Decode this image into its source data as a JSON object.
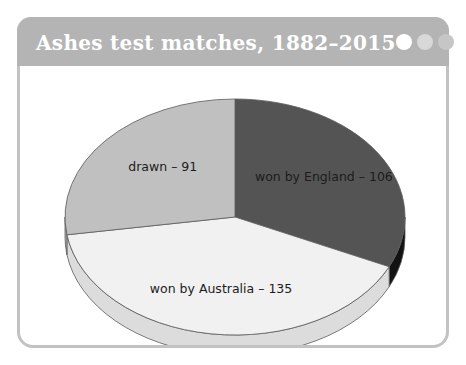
{
  "window": {
    "title": "Ashes test matches, 1882–2015",
    "dots": [
      {
        "name": "window-dot-1",
        "color": "#ffffff"
      },
      {
        "name": "window-dot-2",
        "color": "#d8d8d8"
      },
      {
        "name": "window-dot-3",
        "color": "#c6c6c6"
      }
    ],
    "title_bar_color": "#b4b4b4",
    "frame_border_color": "#c2c2c2",
    "background_color": "#ffffff"
  },
  "chart_data": {
    "type": "pie",
    "title": "Ashes test matches, 1882–2015",
    "xlabel": "",
    "ylabel": "",
    "legend": "none",
    "grid": false,
    "three_d": true,
    "start_angle_deg": 0,
    "direction": "clockwise",
    "total": 332,
    "categories": [
      "won by England",
      "won by Australia",
      "drawn"
    ],
    "values": [
      106,
      135,
      91
    ],
    "labels": [
      "won by England – 106",
      "won by Australia – 135",
      "drawn – 91"
    ],
    "colors": [
      "#545454",
      "#f1f1f1",
      "#c0c0c0"
    ],
    "side_colors": [
      "#121212",
      "#dcdcdc",
      "#b0b0b0"
    ],
    "percentages": [
      31.9,
      40.7,
      27.4
    ],
    "slices": [
      {
        "name": "won by England",
        "value": 106,
        "label": "won by England – 106",
        "color": "#545454",
        "side_color": "#121212",
        "percent": 31.9
      },
      {
        "name": "won by Australia",
        "value": 135,
        "label": "won by Australia – 135",
        "color": "#f1f1f1",
        "side_color": "#dcdcdc",
        "percent": 40.7
      },
      {
        "name": "drawn",
        "value": 91,
        "label": "drawn – 91",
        "color": "#c0c0c0",
        "side_color": "#b0b0b0",
        "percent": 27.4
      }
    ]
  }
}
